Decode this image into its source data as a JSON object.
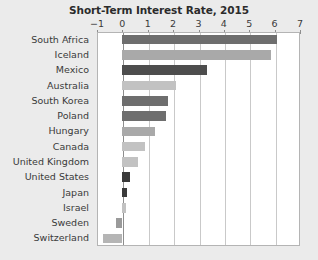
{
  "chart_data": {
    "type": "bar",
    "orientation": "horizontal",
    "title": "Short-Term Interest Rate, 2015",
    "xlabel": "",
    "ylabel": "",
    "xlim": [
      -1,
      7
    ],
    "xticks": [
      -1,
      0,
      1,
      2,
      3,
      4,
      5,
      6,
      7
    ],
    "xtick_labels": [
      "−1",
      "0",
      "1",
      "2",
      "3",
      "4",
      "5",
      "6",
      "7"
    ],
    "grid": true,
    "legend": "none",
    "categories": [
      "South Africa",
      "Iceland",
      "Mexico",
      "Australia",
      "South Korea",
      "Poland",
      "Hungary",
      "Canada",
      "United Kingdom",
      "United States",
      "Japan",
      "Israel",
      "Sweden",
      "Switzerland"
    ],
    "values": [
      6.1,
      5.85,
      3.35,
      2.1,
      1.8,
      1.7,
      1.3,
      0.9,
      0.6,
      0.3,
      0.2,
      0.15,
      -0.25,
      -0.75
    ],
    "bar_colors": [
      "#6e6e6e",
      "#a9a9a9",
      "#4d4d4d",
      "#c2c2c2",
      "#6e6e6e",
      "#6e6e6e",
      "#a9a9a9",
      "#c2c2c2",
      "#c2c2c2",
      "#3a3a3a",
      "#3a3a3a",
      "#c2c2c2",
      "#9a9a9a",
      "#b5b5b5"
    ]
  },
  "style": {
    "page_background": "#ebebeb",
    "plot_background": "#ffffff",
    "gridline_color": "#c9c9c9",
    "axis_color": "#8e8e8e",
    "text_color": "#3a3a3a",
    "title_color": "#2b2b2b"
  }
}
